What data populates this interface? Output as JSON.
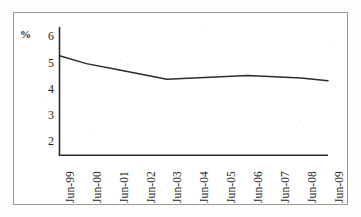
{
  "chart_data": {
    "type": "line",
    "title": "",
    "subtitle": "",
    "xlabel": "",
    "ylabel": "%",
    "ylim": [
      1.5,
      6.4
    ],
    "yticks": [
      6,
      5,
      4,
      3,
      2
    ],
    "grid": false,
    "legend": null,
    "categories": [
      "Jun-99",
      "Jun-00",
      "Jun-01",
      "Jun-02",
      "Jun-03",
      "Jun-04",
      "Jun-05",
      "Jun-06",
      "Jun-07",
      "Jun-08",
      "Jun-09"
    ],
    "values": [
      5.3,
      5.0,
      4.8,
      4.6,
      4.4,
      4.45,
      4.5,
      4.55,
      4.5,
      4.45,
      4.35
    ],
    "series": [
      {
        "name": "rate",
        "values": [
          5.3,
          5.0,
          4.8,
          4.6,
          4.4,
          4.45,
          4.5,
          4.55,
          4.5,
          4.45,
          4.35
        ],
        "color": "#2b2b28"
      }
    ]
  },
  "axes": {
    "unit_label": "%",
    "y_tick_labels": [
      "6",
      "5",
      "4",
      "3",
      "2"
    ],
    "x_tick_labels": [
      "Jun-99",
      "Jun-00",
      "Jun-01",
      "Jun-02",
      "Jun-03",
      "Jun-04",
      "Jun-05",
      "Jun-06",
      "Jun-07",
      "Jun-08",
      "Jun-09"
    ],
    "axis_color": "#2b2b28",
    "border_color": "#9a9a97"
  }
}
